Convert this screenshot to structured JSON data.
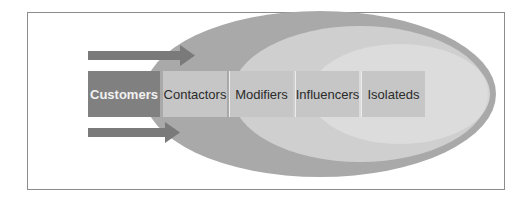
{
  "diagram": {
    "colors": {
      "frame_border": "#8c8c8c",
      "outer_ellipse": "#a9a9a9",
      "middle_ellipse": "#cfcfcf",
      "inner_ellipse": "#e2e2e2",
      "arrow": "#7a7a7a",
      "primary_box": "#808080",
      "segment_box": "#c4c4c4",
      "segment_divider": "#ececec"
    },
    "boxes": [
      {
        "label": "Customers",
        "type": "primary"
      },
      {
        "label": "Contactors",
        "type": "segment"
      },
      {
        "label": "Modifiers",
        "type": "segment"
      },
      {
        "label": "Influencers",
        "type": "segment"
      },
      {
        "label": "Isolateds",
        "type": "segment"
      }
    ],
    "arrows": [
      {
        "name": "top-arrow",
        "direction": "right"
      },
      {
        "name": "bottom-arrow",
        "direction": "right"
      }
    ]
  }
}
